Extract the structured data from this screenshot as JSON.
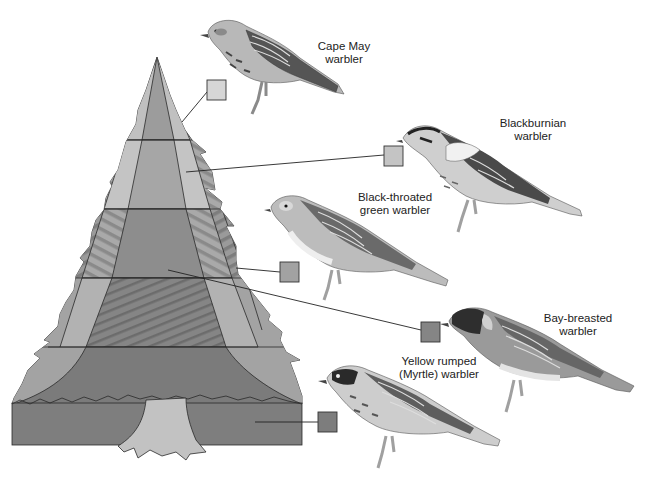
{
  "diagram": {
    "colors": {
      "zone_top": "#d4d4d4",
      "zone_light": "#bcbcbc",
      "zone_mid": "#a6a6a6",
      "zone_dark": "#8c8c8c",
      "zone_darkest": "#777777",
      "trunk": "#c2c2c2",
      "outline": "#2a2a2a",
      "hatch": "#6a6a6a"
    },
    "birds": [
      {
        "name": "cape-may",
        "label_line1": "Cape May",
        "label_line2": "warbler",
        "zone": "treetop outer branches",
        "box_color": "#d6d6d6"
      },
      {
        "name": "blackburnian",
        "label_line1": "Blackburnian",
        "label_line2": "warbler",
        "zone": "upper outer branches",
        "box_color": "#c4c4c4"
      },
      {
        "name": "black-throated-green",
        "label_line1": "Black-throated",
        "label_line2": "green warbler",
        "zone": "middle outer branches",
        "box_color": "#a2a2a2"
      },
      {
        "name": "bay-breasted",
        "label_line1": "Bay-breasted",
        "label_line2": "warbler",
        "zone": "middle interior",
        "box_color": "#858585"
      },
      {
        "name": "yellow-rumped",
        "label_line1": "Yellow rumped",
        "label_line2": "(Myrtle) warbler",
        "zone": "lower branches / ground",
        "box_color": "#7d7d7d"
      }
    ]
  }
}
